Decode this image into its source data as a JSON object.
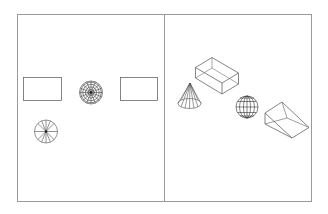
{
  "colors": {
    "background": "#ffffff",
    "frame": "#9a9a9a",
    "stroke": "#555555",
    "dark": "#222222"
  },
  "panels": [
    {
      "name": "top-view",
      "objects": [
        "box-top-view-left",
        "sphere-top-view",
        "box-top-view-right",
        "cone-top-view"
      ]
    },
    {
      "name": "isometric-view",
      "objects": [
        "box-isometric",
        "cone-isometric",
        "sphere-isometric",
        "wedge-isometric"
      ]
    }
  ]
}
